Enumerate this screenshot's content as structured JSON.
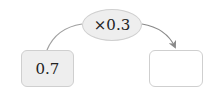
{
  "diagram": {
    "start_value": "0.7",
    "operation": "×0.3",
    "result_value": "",
    "colors": {
      "box_fill": "#eeeeee",
      "box_border": "#cfcfcf",
      "arrow": "#8a8a8a",
      "text": "#222222"
    }
  }
}
